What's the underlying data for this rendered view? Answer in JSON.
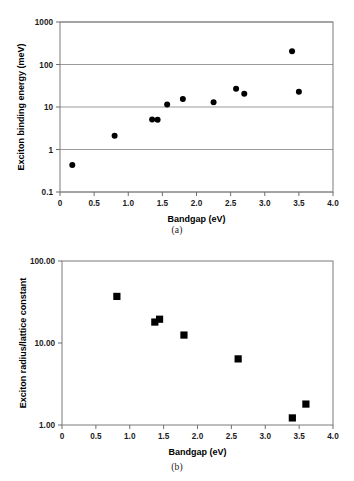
{
  "figure": {
    "panel_a_caption": "(a)",
    "panel_b_caption": "(b)"
  },
  "chart_data": [
    {
      "id": "panel-a",
      "type": "scatter",
      "title": "",
      "xlabel": "Bandgap (eV)",
      "ylabel": "Exciton binding energy (meV)",
      "xlim": [
        0,
        4.0
      ],
      "ylim": [
        0.1,
        1000
      ],
      "yscale": "log",
      "xscale": "linear",
      "grid": "horizontal",
      "legend": "none",
      "marker": "filled-circle",
      "xticks": [
        0,
        0.5,
        1.0,
        1.5,
        2.0,
        2.5,
        3.0,
        3.5,
        4.0
      ],
      "xticklabels": [
        "0",
        "0.5",
        "1.0",
        "1.5",
        "2.0",
        "2.5",
        "3.0",
        "3.5",
        "4.0"
      ],
      "yticks": [
        0.1,
        1,
        10,
        100,
        1000
      ],
      "yticklabels": [
        "0.1",
        "1",
        "10",
        "100",
        "1000"
      ],
      "points": [
        {
          "x": 0.18,
          "y": 0.43
        },
        {
          "x": 0.8,
          "y": 2.1
        },
        {
          "x": 1.35,
          "y": 5.1
        },
        {
          "x": 1.43,
          "y": 5.0
        },
        {
          "x": 1.57,
          "y": 11.5
        },
        {
          "x": 1.8,
          "y": 15.5
        },
        {
          "x": 2.25,
          "y": 13.0
        },
        {
          "x": 2.58,
          "y": 27.0
        },
        {
          "x": 2.7,
          "y": 20.5
        },
        {
          "x": 3.4,
          "y": 205.0
        },
        {
          "x": 3.5,
          "y": 23.0
        }
      ]
    },
    {
      "id": "panel-b",
      "type": "scatter",
      "title": "",
      "xlabel": "Bandgap (eV)",
      "ylabel": "Exciton radius/lattice constant",
      "xlim": [
        0,
        4.0
      ],
      "ylim": [
        1.0,
        100.0
      ],
      "yscale": "log",
      "xscale": "linear",
      "grid": "none",
      "legend": "none",
      "marker": "filled-square",
      "xticks": [
        0,
        0.5,
        1.0,
        1.5,
        2.0,
        2.5,
        3.0,
        3.5,
        4.0
      ],
      "xticklabels": [
        "0",
        "0.5",
        "1.0",
        "1.5",
        "2.0",
        "2.5",
        "3.0",
        "3.5",
        "4.0"
      ],
      "yticks": [
        1.0,
        10.0,
        100.0
      ],
      "yticklabels": [
        "1.00",
        "10.00",
        "100.00"
      ],
      "points": [
        {
          "x": 0.81,
          "y": 37.0
        },
        {
          "x": 1.37,
          "y": 18.0
        },
        {
          "x": 1.44,
          "y": 19.5
        },
        {
          "x": 1.8,
          "y": 12.5
        },
        {
          "x": 2.6,
          "y": 6.4
        },
        {
          "x": 3.4,
          "y": 1.22
        },
        {
          "x": 3.6,
          "y": 1.8
        }
      ]
    }
  ]
}
